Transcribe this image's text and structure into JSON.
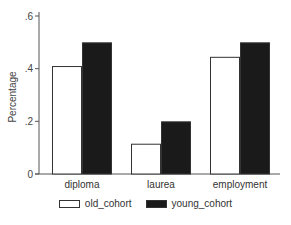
{
  "chart_data": {
    "type": "bar",
    "title": "",
    "xlabel": "",
    "ylabel": "Percentage",
    "ylim": [
      0,
      0.6
    ],
    "yticks": [
      0,
      0.2,
      0.4,
      0.6
    ],
    "ytick_labels": [
      "0",
      ".2",
      ".4",
      ".6"
    ],
    "categories": [
      "diploma",
      "laurea",
      "employment"
    ],
    "series": [
      {
        "name": "old_cohort",
        "color": "#ffffff",
        "values": [
          0.41,
          0.115,
          0.445
        ]
      },
      {
        "name": "young_cohort",
        "color": "#1a1a1a",
        "values": [
          0.5,
          0.2,
          0.5
        ]
      }
    ],
    "grid": false,
    "legend_position": "bottom"
  }
}
